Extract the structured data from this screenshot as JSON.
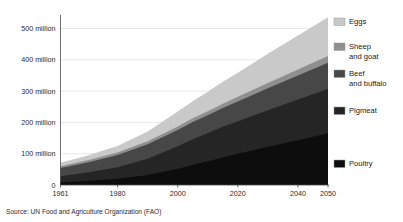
{
  "chart_data": {
    "type": "area",
    "stacked": true,
    "title": "",
    "subtitle": "",
    "xlabel": "",
    "ylabel": "",
    "source": "Source: UN Food and Agriculture Organization (FAO)",
    "grid": true,
    "legend_position": "right",
    "xlim": [
      1961,
      2050
    ],
    "ylim": [
      0,
      540
    ],
    "unit": "million",
    "x_tick_labels": [
      "1961",
      "1980",
      "2000",
      "2020",
      "2040",
      "2050"
    ],
    "x_ticks": [
      1961,
      1980,
      2000,
      2020,
      2040,
      2050
    ],
    "y_tick_labels": [
      "0",
      "100 million",
      "200 million",
      "300 million",
      "400 million",
      "500 million"
    ],
    "y_ticks": [
      0,
      100,
      200,
      300,
      400,
      500
    ],
    "x": [
      1961,
      1970,
      1980,
      1990,
      2000,
      2005,
      2010,
      2015,
      2020,
      2030,
      2040,
      2050
    ],
    "series": [
      {
        "name": "Poultry",
        "color": "#0d0d0d",
        "values": [
          8,
          13,
          20,
          32,
          52,
          64,
          76,
          88,
          100,
          122,
          143,
          165
        ]
      },
      {
        "name": "Pigmeat",
        "color": "#252525",
        "values": [
          20,
          27,
          37,
          52,
          72,
          82,
          90,
          98,
          104,
          117,
          130,
          142
        ]
      },
      {
        "name": "Beef and buffalo",
        "color": "#474747",
        "values": [
          26,
          32,
          39,
          46,
          52,
          55,
          57,
          60,
          63,
          70,
          77,
          84
        ]
      },
      {
        "name": "Sheep and goat",
        "color": "#8f8f8f",
        "values": [
          6,
          7,
          8,
          10,
          11,
          12,
          13,
          14,
          15,
          17,
          19,
          21
        ]
      },
      {
        "name": "Eggs",
        "color": "#c9c9c9",
        "values": [
          11,
          15,
          21,
          31,
          48,
          55,
          62,
          70,
          77,
          93,
          109,
          124
        ]
      }
    ],
    "totals_endpoints": {
      "1961": 71,
      "2050": 536
    }
  },
  "legend": {
    "items": [
      {
        "label": "Eggs",
        "color": "#c9c9c9"
      },
      {
        "label": "Sheep and goat",
        "label_line1": "Sheep",
        "label_line2": "and goat",
        "color": "#8f8f8f"
      },
      {
        "label": "Beef and buffalo",
        "label_line1": "Beef",
        "label_line2": "and buffalo",
        "color": "#474747"
      },
      {
        "label": "Pigmeat",
        "color": "#252525"
      },
      {
        "label": "Poultry",
        "color": "#0d0d0d"
      }
    ]
  },
  "footer": {
    "source": "Source: UN Food and Agriculture Organization (FAO)"
  }
}
